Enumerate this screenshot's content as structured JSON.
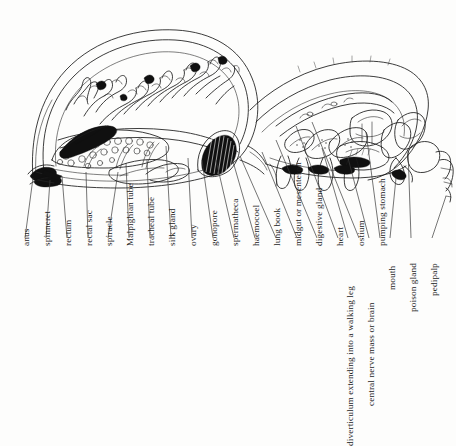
{
  "figure": {
    "view": "lateral longitudinal section",
    "background_color": "#fdfdfc",
    "ink_color": "#1a1a1a",
    "label_orientation": "rotated-90-ccw",
    "label_count": 19
  },
  "labels": [
    {
      "id": "anus",
      "text": "anus",
      "x": 26,
      "y": 246,
      "line_top_x": 33,
      "line_top_y": 175,
      "line_bottom_x": 25,
      "line_bottom_y": 238
    },
    {
      "id": "spinneret",
      "text": "spinneret",
      "x": 47,
      "y": 246,
      "line_top_x": 50,
      "line_top_y": 177,
      "line_bottom_x": 46,
      "line_bottom_y": 238
    },
    {
      "id": "rectum",
      "text": "rectum",
      "x": 68,
      "y": 246,
      "line_top_x": 63,
      "line_top_y": 171,
      "line_bottom_x": 67,
      "line_bottom_y": 238
    },
    {
      "id": "rectal-sac",
      "text": "rectal sac",
      "x": 89,
      "y": 246,
      "line_top_x": 84,
      "line_top_y": 163,
      "line_bottom_x": 88,
      "line_bottom_y": 238
    },
    {
      "id": "spiracle",
      "text": "spiracle",
      "x": 109,
      "y": 246,
      "line_top_x": 117,
      "line_top_y": 168,
      "line_bottom_x": 108,
      "line_bottom_y": 238
    },
    {
      "id": "malpighian-tube",
      "text": "Malpighian tube",
      "x": 130,
      "y": 246,
      "line_top_x": 124,
      "line_top_y": 158,
      "line_bottom_x": 129,
      "line_bottom_y": 238
    },
    {
      "id": "tracheal-tube",
      "text": "tracheal tube",
      "x": 151,
      "y": 246,
      "line_top_x": 145,
      "line_top_y": 155,
      "line_bottom_x": 150,
      "line_bottom_y": 238
    },
    {
      "id": "silk-gland",
      "text": "silk gland",
      "x": 172,
      "y": 246,
      "line_top_x": 168,
      "line_top_y": 139,
      "line_bottom_x": 171,
      "line_bottom_y": 238
    },
    {
      "id": "ovary",
      "text": "ovary",
      "x": 193,
      "y": 246,
      "line_top_x": 188,
      "line_top_y": 150,
      "line_bottom_x": 192,
      "line_bottom_y": 238
    },
    {
      "id": "gonopore",
      "text": "gonopore",
      "x": 214,
      "y": 246,
      "line_top_x": 203,
      "line_top_y": 152,
      "line_bottom_x": 213,
      "line_bottom_y": 238
    },
    {
      "id": "spermatheca",
      "text": "spermatheca",
      "x": 235,
      "y": 246,
      "line_top_x": 219,
      "line_top_y": 152,
      "line_bottom_x": 234,
      "line_bottom_y": 238
    },
    {
      "id": "haemocoel",
      "text": "haemocoel",
      "x": 256,
      "y": 246,
      "line_top_x": 233,
      "line_top_y": 150,
      "line_bottom_x": 255,
      "line_bottom_y": 238
    },
    {
      "id": "lung-book",
      "text": "lung book",
      "x": 277,
      "y": 246,
      "line_top_x": 243,
      "line_top_y": 148,
      "line_bottom_x": 276,
      "line_bottom_y": 238
    },
    {
      "id": "midgut-or-mesenteron",
      "text": "midgut or mesenteron",
      "x": 298,
      "y": 246,
      "line_top_x": 262,
      "line_top_y": 146,
      "line_bottom_x": 297,
      "line_bottom_y": 238
    },
    {
      "id": "digestive-gland",
      "text": "digestive gland",
      "x": 318,
      "y": 246,
      "line_top_x": 277,
      "line_top_y": 133,
      "line_bottom_x": 317,
      "line_bottom_y": 238
    },
    {
      "id": "heart",
      "text": "heart",
      "x": 339,
      "y": 246,
      "line_top_x": 296,
      "line_top_y": 122,
      "line_bottom_x": 338,
      "line_bottom_y": 238
    },
    {
      "id": "ostium",
      "text": "ostium",
      "x": 360,
      "y": 246,
      "line_top_x": 313,
      "line_top_y": 118,
      "line_bottom_x": 359,
      "line_bottom_y": 238
    },
    {
      "id": "pumping-stomach",
      "text": "pumping stomach",
      "x": 381,
      "y": 246,
      "line_top_x": 349,
      "line_top_y": 125,
      "line_bottom_x": 380,
      "line_bottom_y": 238
    },
    {
      "id": "diverticulum-walking-leg",
      "text": "diverticulum extending into a walking leg",
      "x": 349,
      "y": 246,
      "line_top_x": 325,
      "line_top_y": 140,
      "line_bottom_x": 348,
      "line_bottom_y": 238
    },
    {
      "id": "central-nerve-mass-or-brain",
      "text": "central nerve mass or brain",
      "x": 370,
      "y": 246,
      "line_top_x": 344,
      "line_top_y": 148,
      "line_bottom_x": 369,
      "line_bottom_y": 238
    },
    {
      "id": "mouth",
      "text": "mouth",
      "x": 391,
      "y": 246,
      "line_top_x": 371,
      "line_top_y": 160,
      "line_bottom_x": 390,
      "line_bottom_y": 238
    },
    {
      "id": "poison-gland",
      "text": "poison gland",
      "x": 412,
      "y": 246,
      "line_top_x": 401,
      "line_top_y": 145,
      "line_bottom_x": 411,
      "line_bottom_y": 238
    },
    {
      "id": "pedipalp",
      "text": "pedipalp",
      "x": 433,
      "y": 246,
      "line_top_x": 441,
      "line_top_y": 160,
      "line_bottom_x": 432,
      "line_bottom_y": 238
    }
  ],
  "label_order": [
    "anus",
    "spinneret",
    "rectum",
    "rectal sac",
    "spiracle",
    "Malpighian tube",
    "tracheal tube",
    "silk gland",
    "ovary",
    "gonopore",
    "spermatheca",
    "haemocoel",
    "lung book",
    "midgut or mesenteron",
    "digestive gland",
    "heart",
    "ostium",
    "pumping stomach",
    "diverticulum extending into a walking leg",
    "central nerve mass or brain",
    "mouth",
    "poison gland",
    "pedipalp"
  ]
}
